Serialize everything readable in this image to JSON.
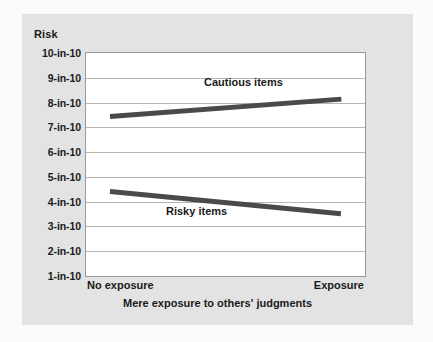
{
  "chart_data": {
    "type": "line",
    "title": "",
    "ylabel": "Risk",
    "xlabel": "Mere exposure to others' judgments",
    "categories": [
      "No exposure",
      "Exposure"
    ],
    "ytick_labels": [
      "1-in-10",
      "2-in-10",
      "3-in-10",
      "4-in-10",
      "5-in-10",
      "6-in-10",
      "7-in-10",
      "8-in-10",
      "9-in-10",
      "10-in-10"
    ],
    "ytick_values": [
      1,
      2,
      3,
      4,
      5,
      6,
      7,
      8,
      9,
      10
    ],
    "ylim": [
      1,
      10
    ],
    "grid": true,
    "legend_position": "inline-annotation",
    "line_color": "#4a4a4a",
    "series": [
      {
        "name": "Cautious items",
        "values": [
          7.45,
          8.15
        ]
      },
      {
        "name": "Risky items",
        "values": [
          4.4,
          3.5
        ]
      }
    ]
  },
  "figure": {
    "panel_background": "#e3e3e3",
    "plot_background": "#ffffff",
    "page_background": "#fbfbfb"
  }
}
